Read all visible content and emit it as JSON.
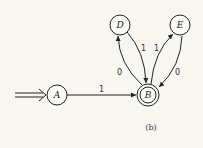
{
  "diagram": {
    "type": "state-machine",
    "caption": "(b)",
    "start_state": "A",
    "accepting_states": [
      "B"
    ],
    "states": [
      {
        "id": "A",
        "label": "A"
      },
      {
        "id": "B",
        "label": "B"
      },
      {
        "id": "D",
        "label": "D"
      },
      {
        "id": "E",
        "label": "E"
      }
    ],
    "transitions": [
      {
        "from": "A",
        "to": "B",
        "label": "1"
      },
      {
        "from": "B",
        "to": "D",
        "label": "0"
      },
      {
        "from": "D",
        "to": "B",
        "label": "1"
      },
      {
        "from": "B",
        "to": "E",
        "label": "1"
      },
      {
        "from": "E",
        "to": "B",
        "label": "0"
      }
    ]
  }
}
